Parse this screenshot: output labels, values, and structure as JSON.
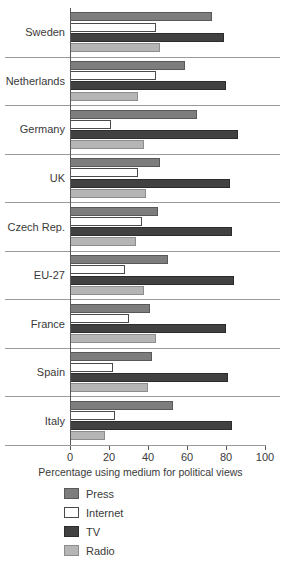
{
  "chart_data": {
    "type": "bar",
    "orientation": "horizontal",
    "title": "",
    "xlabel": "Percentage using medium for political views",
    "ylabel": "",
    "xlim": [
      0,
      100
    ],
    "xticks": [
      0,
      20,
      40,
      60,
      80,
      100
    ],
    "grid": false,
    "legend_position": "bottom-left",
    "categories": [
      "Sweden",
      "Netherlands",
      "Germany",
      "UK",
      "Czech Rep.",
      "EU-27",
      "France",
      "Spain",
      "Italy"
    ],
    "series": [
      {
        "name": "Press",
        "color": "#7d7d7d",
        "values": [
          73,
          59,
          65,
          46,
          45,
          50,
          41,
          42,
          53
        ]
      },
      {
        "name": "Internet",
        "color": "#ffffff",
        "values": [
          44,
          44,
          21,
          35,
          37,
          28,
          30,
          22,
          23
        ]
      },
      {
        "name": "TV",
        "color": "#414141",
        "values": [
          79,
          80,
          86,
          82,
          83,
          84,
          80,
          81,
          83
        ]
      },
      {
        "name": "Radio",
        "color": "#b5b5b5",
        "values": [
          46,
          35,
          38,
          39,
          34,
          38,
          44,
          40,
          18
        ]
      }
    ]
  },
  "legend": {
    "items": [
      {
        "label": "Press",
        "key": "press"
      },
      {
        "label": "Internet",
        "key": "internet"
      },
      {
        "label": "TV",
        "key": "tv"
      },
      {
        "label": "Radio",
        "key": "radio"
      }
    ]
  }
}
